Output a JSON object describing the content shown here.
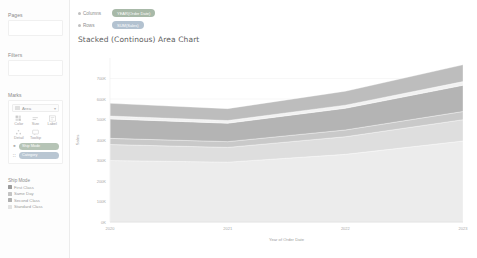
{
  "sidebar": {
    "pages": {
      "label": "Pages"
    },
    "filters": {
      "label": "Filters"
    },
    "marks": {
      "label": "Marks",
      "mark_type": "Area",
      "caret": "▾",
      "properties": [
        {
          "name": "color",
          "label": "Color",
          "icon": "color-palette-icon"
        },
        {
          "name": "size",
          "label": "Size",
          "icon": "size-icon"
        },
        {
          "name": "label",
          "label": "Label",
          "icon": "label-icon"
        },
        {
          "name": "detail",
          "label": "Detail",
          "icon": "detail-icon"
        },
        {
          "name": "tooltip",
          "label": "Tooltip",
          "icon": "tooltip-icon"
        }
      ],
      "pills": [
        {
          "name": "color-pill",
          "text": "Ship Mode",
          "icon": "■",
          "color": "green"
        },
        {
          "name": "detail-pill",
          "text": "Category",
          "icon": "∷",
          "color": "blue"
        }
      ]
    },
    "legend": {
      "title": "Ship Mode",
      "items": [
        {
          "label": "First Class",
          "color": "#9b9b9b"
        },
        {
          "label": "Same Day",
          "color": "#c4c4c4"
        },
        {
          "label": "Second Class",
          "color": "#b0b0b0"
        },
        {
          "label": "Standard Class",
          "color": "#e2e2e2"
        }
      ]
    }
  },
  "shelves": {
    "columns": {
      "label": "Columns",
      "pill": "YEAR(Order Date)",
      "type": "green"
    },
    "rows": {
      "label": "Rows",
      "pill": "SUM(Sales)",
      "type": "blue"
    }
  },
  "worksheet": {
    "title": "Stacked (Continous) Area Chart"
  },
  "chart_data": {
    "type": "area",
    "title": "Stacked (Continous) Area Chart",
    "xlabel": "Year of Order Date",
    "ylabel": "Sales",
    "x": [
      "2020",
      "2021",
      "2022",
      "2023"
    ],
    "ylim": [
      0,
      800000
    ],
    "yticks": [
      0,
      100000,
      200000,
      300000,
      400000,
      500000,
      600000,
      700000
    ],
    "ytick_labels": [
      "0K",
      "100K",
      "200K",
      "300K",
      "400K",
      "500K",
      "600K",
      "700K"
    ],
    "grid": true,
    "legend_position": "left-sidebar",
    "stacked": true,
    "series": [
      {
        "name": "Standard Class",
        "color": "#ececec",
        "values": [
          300000,
          292000,
          330000,
          395000
        ]
      },
      {
        "name": "Second Class",
        "color": "#dedede",
        "values": [
          78000,
          72000,
          86000,
          104000
        ]
      },
      {
        "name": "Same Day",
        "color": "#c9c9c9",
        "values": [
          30000,
          28000,
          33000,
          40000
        ]
      },
      {
        "name": "First Class",
        "color": "#b4b4b4",
        "values": [
          95000,
          90000,
          106000,
          128000
        ]
      },
      {
        "name": "Other",
        "color": "#f2f2f2",
        "values": [
          14000,
          13000,
          15000,
          18000
        ]
      },
      {
        "name": "Top Band",
        "color": "#bdbdbd",
        "values": [
          62000,
          58000,
          68000,
          82000
        ]
      }
    ]
  }
}
